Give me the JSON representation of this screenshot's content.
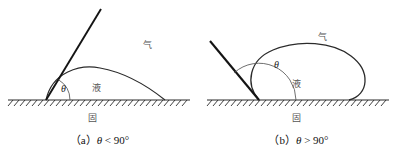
{
  "figure": {
    "title_absent": true,
    "panels": [
      {
        "id": "a",
        "caption_prefix": "（a）",
        "caption_symbol": "θ",
        "caption_relation": "< 90°",
        "gas_label": "气",
        "liquid_label": "液",
        "solid_label": "固",
        "angle_label": "θ",
        "angle_description": "acute contact angle, wetting droplet",
        "contact_angle_deg": 62,
        "tangent_direction": "up-right"
      },
      {
        "id": "b",
        "caption_prefix": "（b）",
        "caption_symbol": "θ",
        "caption_relation": "> 90°",
        "gas_label": "气",
        "liquid_label": "液",
        "solid_label": "固",
        "angle_label": "θ",
        "angle_description": "obtuse contact angle, non-wetting droplet",
        "contact_angle_deg": 132,
        "tangent_direction": "up-left"
      }
    ],
    "colors": {
      "background": "#ffffff",
      "curve": "#2b2b2b",
      "tangent": "#141414",
      "substrate": "#2b2b2b",
      "hatch": "#2b2b2b",
      "label_text": "#555555",
      "caption_text": "#111111"
    }
  }
}
